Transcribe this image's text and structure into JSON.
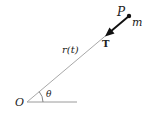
{
  "diagram": {
    "type": "polar-position-vector",
    "labels": {
      "origin": "O",
      "point": "P",
      "mass": "m",
      "radius": "r(t)",
      "angle": "θ",
      "tension": "T"
    },
    "colors": {
      "radius_line": "#a8a8a8",
      "axis_line": "#9a9a9a",
      "arrow": "#111111",
      "text": "#222222"
    },
    "geometry": {
      "origin": [
        27,
        102
      ],
      "point": [
        129,
        16
      ],
      "axis_end": [
        77,
        102
      ],
      "arrow_tip": [
        106,
        36
      ]
    }
  }
}
